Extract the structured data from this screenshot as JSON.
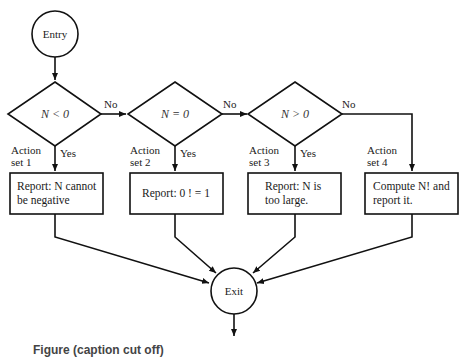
{
  "diagram": {
    "type": "flowchart",
    "entry": {
      "label": "Entry"
    },
    "exit": {
      "label": "Exit"
    },
    "decisions": [
      {
        "condition": "N < 0",
        "yes": "Yes",
        "no": "No"
      },
      {
        "condition": "N = 0",
        "yes": "Yes",
        "no": "No"
      },
      {
        "condition": "N > 0",
        "yes": "Yes",
        "no": "No"
      }
    ],
    "actions": [
      {
        "set_line1": "Action",
        "set_line2": "set 1",
        "line1": "Report: N cannot",
        "line2": "be negative"
      },
      {
        "set_line1": "Action",
        "set_line2": "set 2",
        "line1": "Report: 0 ! = 1",
        "line2": ""
      },
      {
        "set_line1": "Action",
        "set_line2": "set 3",
        "line1": "Report: N is",
        "line2": "too large."
      },
      {
        "set_line1": "Action",
        "set_line2": "set 4",
        "line1": "Compute N! and",
        "line2": "report it."
      }
    ],
    "caption_partial": "Figure (caption cut off)"
  }
}
